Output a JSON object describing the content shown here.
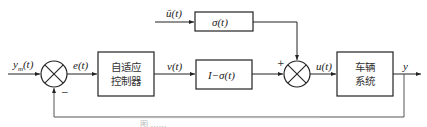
{
  "diagram": {
    "type": "block-diagram",
    "signals": {
      "reference_input": "y_m(t)",
      "reference_base": "y",
      "reference_sub": "m",
      "reference_arg": "(t)",
      "error": "e(t)",
      "controller_output": "v(t)",
      "external_input": "ū(t)",
      "control_input": "u(t)",
      "output": "y"
    },
    "blocks": {
      "adaptive_controller": {
        "line1": "自适应",
        "line2": "控制器"
      },
      "sigma": {
        "label": "σ(t)"
      },
      "one_minus_sigma": {
        "label": "I−σ(t)"
      },
      "vehicle_system": {
        "line1": "车辆",
        "line2": "系统"
      }
    },
    "junctions": {
      "sum1": {
        "feedback_sign": "−"
      },
      "sum2": {
        "input_sign": "+"
      }
    },
    "caption": "图 ……"
  },
  "colors": {
    "stroke": "#222222",
    "feedback_line": "#555555",
    "background": "#ffffff"
  }
}
